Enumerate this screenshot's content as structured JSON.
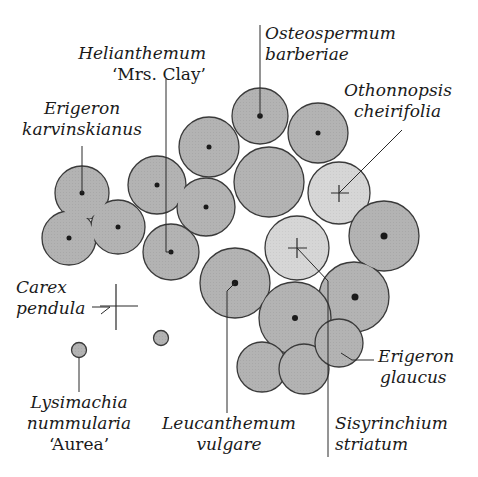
{
  "colors": {
    "dark_fill": "#b3b3b3",
    "light_fill": "#d4d4d4",
    "stroke": "#3a3a3a",
    "text": "#1a1a1a",
    "background": "#ffffff"
  },
  "plants": [
    {
      "id": "osteospermum",
      "line1": "Osteospermum",
      "line2": "barberiae",
      "line3": ""
    },
    {
      "id": "helianthemum",
      "line1": "Helianthemum",
      "line2": "‘Mrs. Clay’",
      "line3": ""
    },
    {
      "id": "erigeron-karvinskianus",
      "line1": "Erigeron",
      "line2": "karvinskianus",
      "line3": ""
    },
    {
      "id": "othonnopsis",
      "line1": "Othonnopsis",
      "line2": "cheirifolia",
      "line3": ""
    },
    {
      "id": "carex",
      "line1": "Carex",
      "line2": "pendula",
      "line3": ""
    },
    {
      "id": "lysimachia",
      "line1": "Lysimachia",
      "line2": "nummularia",
      "line3": "‘Aurea’"
    },
    {
      "id": "leucanthemum",
      "line1": "Leucanthemum",
      "line2": "vulgare",
      "line3": ""
    },
    {
      "id": "erigeron-glaucus",
      "line1": "Erigeron",
      "line2": "glaucus",
      "line3": ""
    },
    {
      "id": "sisyrinchium",
      "line1": "Sisyrinchium",
      "line2": "striatum",
      "line3": ""
    }
  ]
}
